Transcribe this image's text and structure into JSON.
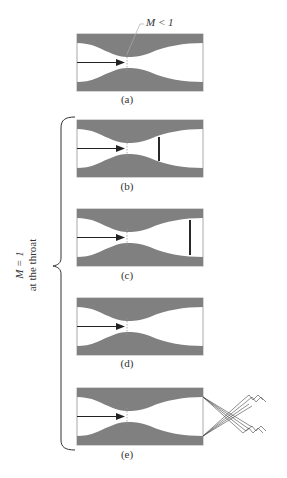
{
  "figure": {
    "title_annotation": "M < 1",
    "side_label": {
      "line1": "M = 1",
      "line2": "at the throat"
    },
    "colors": {
      "wall": "#808080",
      "frame": "#aaaaaa",
      "arrow": "#222222",
      "shock": "#111111",
      "throat_line": "#999999"
    },
    "panels": [
      {
        "id": "a",
        "label": "(a)",
        "top": 34,
        "shock_x": null,
        "exit_waves": false
      },
      {
        "id": "b",
        "label": "(b)",
        "top": 120,
        "shock_x": 159,
        "exit_waves": false
      },
      {
        "id": "c",
        "label": "(c)",
        "top": 209,
        "shock_x": 190,
        "exit_waves": false
      },
      {
        "id": "d",
        "label": "(d)",
        "top": 298,
        "shock_x": null,
        "exit_waves": false
      },
      {
        "id": "e",
        "label": "(e)",
        "top": 388,
        "shock_x": null,
        "exit_waves": true
      }
    ]
  }
}
